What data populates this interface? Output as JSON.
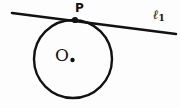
{
  "figure": {
    "kind": "geometry-diagram",
    "background_color": "#fdfdfd",
    "ink_color": "#121212",
    "width": 180,
    "height": 108
  },
  "labels": {
    "tangent_point": "P",
    "center": "O",
    "line_name": "ℓ",
    "line_subscript": "1"
  },
  "geometry": {
    "circle": {
      "center_x": 73,
      "center_y": 59,
      "radius": 39,
      "stroke_width": 2.4
    },
    "center_dot": {
      "x": 72.5,
      "y": 60,
      "radius": 2.2
    },
    "tangent_point_dot": {
      "x": 75,
      "y": 20,
      "radius": 3.1
    },
    "line": {
      "x1": 12,
      "y1": 13,
      "x2": 176,
      "y2": 34,
      "stroke_width": 2.6
    }
  }
}
